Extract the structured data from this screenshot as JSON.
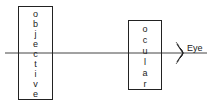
{
  "diagram": {
    "objective": {
      "label": "objective",
      "letters": [
        "o",
        "b",
        "j",
        "e",
        "c",
        "t",
        "i",
        "v",
        "e"
      ]
    },
    "ocular": {
      "label": "ocular",
      "letters": [
        "o",
        "c",
        "u",
        "l",
        "a",
        "r"
      ]
    },
    "eye_label": "Eye",
    "colors": {
      "stroke": "#222222",
      "background": "#ffffff"
    }
  }
}
